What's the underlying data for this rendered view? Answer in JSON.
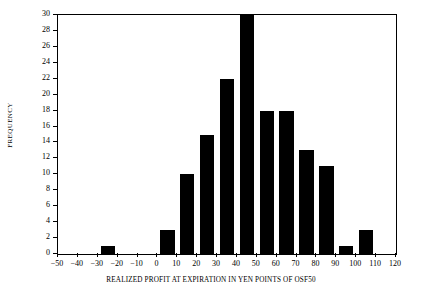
{
  "chart_data": {
    "type": "bar",
    "title": "",
    "xlabel": "REALIZED PROFIT AT EXPIRATION IN YEN POINTS OF OSF50",
    "ylabel": "FREQUENCY",
    "xlim": [
      -50,
      120
    ],
    "ylim": [
      0,
      30
    ],
    "xtick_step": 10,
    "ytick_step": 2,
    "grid": false,
    "legend": false,
    "bar_color": "#000000",
    "background_color": "#ffffff",
    "axis_color": "#000000",
    "bin_width": 10,
    "bar_fill_fraction": 0.72,
    "xticks": [
      "-50",
      "-40",
      "-30",
      "-20",
      "-10",
      "0",
      "10",
      "20",
      "30",
      "40",
      "50",
      "60",
      "70",
      "80",
      "90",
      "100",
      "110",
      "120"
    ],
    "xtick_values": [
      -50,
      -40,
      -30,
      -20,
      -10,
      0,
      10,
      20,
      30,
      40,
      50,
      60,
      70,
      80,
      90,
      100,
      110,
      120
    ],
    "yticks": [
      "0",
      "2",
      "4",
      "6",
      "8",
      "10",
      "12",
      "14",
      "16",
      "18",
      "20",
      "22",
      "24",
      "26",
      "28",
      "30"
    ],
    "ytick_values": [
      0,
      2,
      4,
      6,
      8,
      10,
      12,
      14,
      16,
      18,
      20,
      22,
      24,
      26,
      28,
      30
    ],
    "categories": [
      -50,
      -40,
      -30,
      -20,
      -10,
      0,
      10,
      20,
      30,
      40,
      50,
      60,
      70,
      80,
      90,
      100,
      110
    ],
    "values": [
      0,
      0,
      1,
      0,
      0,
      3,
      10,
      15,
      22,
      30,
      18,
      18,
      13,
      11,
      1,
      3,
      0
    ],
    "bars": [
      {
        "bin_start": -30,
        "bin_end": -20,
        "value": 1
      },
      {
        "bin_start": 0,
        "bin_end": 10,
        "value": 3
      },
      {
        "bin_start": 10,
        "bin_end": 20,
        "value": 10
      },
      {
        "bin_start": 20,
        "bin_end": 30,
        "value": 15
      },
      {
        "bin_start": 30,
        "bin_end": 40,
        "value": 22
      },
      {
        "bin_start": 40,
        "bin_end": 50,
        "value": 30
      },
      {
        "bin_start": 50,
        "bin_end": 60,
        "value": 18
      },
      {
        "bin_start": 60,
        "bin_end": 70,
        "value": 18
      },
      {
        "bin_start": 70,
        "bin_end": 80,
        "value": 13
      },
      {
        "bin_start": 80,
        "bin_end": 90,
        "value": 11
      },
      {
        "bin_start": 90,
        "bin_end": 100,
        "value": 1
      },
      {
        "bin_start": 100,
        "bin_end": 110,
        "value": 3
      }
    ]
  }
}
